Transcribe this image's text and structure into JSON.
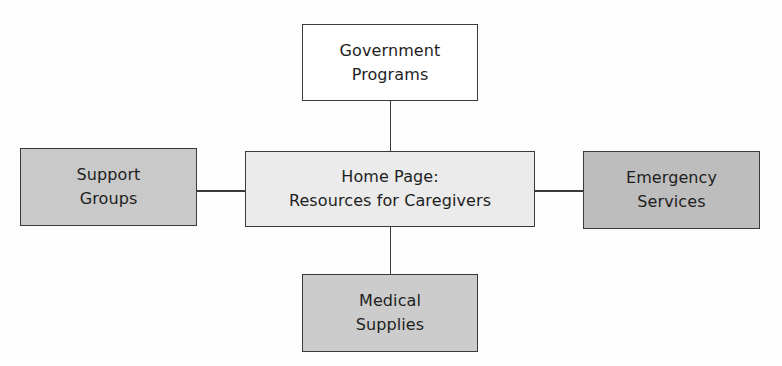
{
  "diagram": {
    "type": "site-map",
    "nodes": [
      {
        "id": "home",
        "lines": [
          "Home Page:",
          "Resources for Caregivers"
        ],
        "fill": "#ebebeb",
        "box": {
          "x": 245,
          "y": 151,
          "w": 290,
          "h": 76
        }
      },
      {
        "id": "government",
        "lines": [
          "Government",
          "Programs"
        ],
        "fill": "#ffffff",
        "box": {
          "x": 302,
          "y": 24,
          "w": 176,
          "h": 77
        }
      },
      {
        "id": "support",
        "lines": [
          "Support",
          "Groups"
        ],
        "fill": "#c9c9c9",
        "box": {
          "x": 20,
          "y": 148,
          "w": 177,
          "h": 78
        }
      },
      {
        "id": "emergency",
        "lines": [
          "Emergency",
          "Services"
        ],
        "fill": "#bdbdbd",
        "box": {
          "x": 583,
          "y": 151,
          "w": 177,
          "h": 78
        }
      },
      {
        "id": "medical",
        "lines": [
          "Medical",
          "Supplies"
        ],
        "fill": "#cccccc",
        "box": {
          "x": 302,
          "y": 274,
          "w": 176,
          "h": 78
        }
      }
    ],
    "edges": [
      {
        "from": "home",
        "to": "government"
      },
      {
        "from": "home",
        "to": "support"
      },
      {
        "from": "home",
        "to": "emergency"
      },
      {
        "from": "home",
        "to": "medical"
      }
    ]
  }
}
